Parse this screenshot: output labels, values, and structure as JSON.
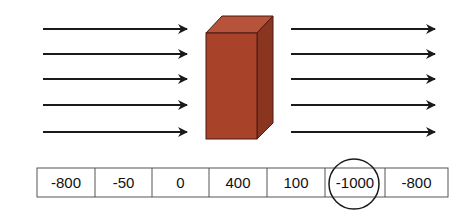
{
  "diagram": {
    "colors": {
      "arrow": "#1a1a1a",
      "block_front": "#a8432a",
      "block_top": "#b6533a",
      "block_side": "#8a3520",
      "block_edge": "#4a1a10",
      "cell_border": "#555555",
      "circle": "#1a1a1a"
    },
    "left_arrows": {
      "count": 5
    },
    "right_arrows": {
      "count": 5
    },
    "block": {
      "shape": "rectangular-prism"
    },
    "cells": [
      {
        "label": "-800"
      },
      {
        "label": "-50"
      },
      {
        "label": "0"
      },
      {
        "label": "400"
      },
      {
        "label": "100"
      },
      {
        "label": "-1000",
        "circled": true
      },
      {
        "label": "-800"
      }
    ]
  }
}
